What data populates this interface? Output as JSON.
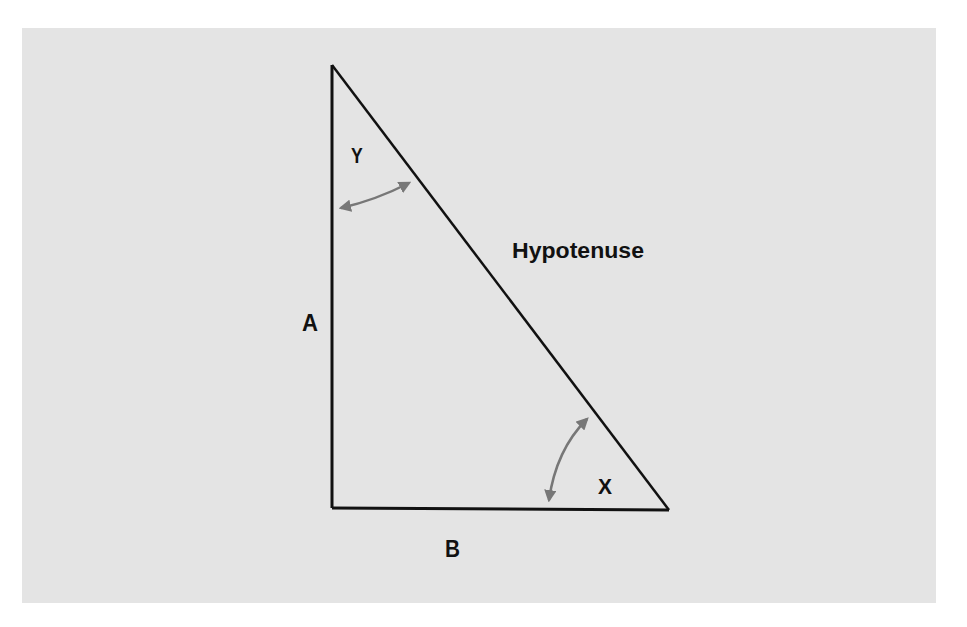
{
  "diagram": {
    "type": "right-triangle",
    "background_color": "#e4e4e4",
    "line_color": "#111111",
    "arrow_color": "#777777",
    "labels": {
      "hypotenuse": "Hypotenuse",
      "side_a": "A",
      "side_b": "B",
      "angle_x": "X",
      "angle_y": "Y"
    },
    "vertices": {
      "top": [
        332,
        65
      ],
      "right_angle": [
        332,
        508
      ],
      "bottom_right": [
        669,
        510
      ]
    }
  }
}
